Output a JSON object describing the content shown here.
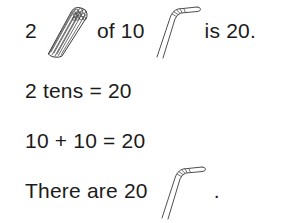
{
  "page": {
    "type": "math-worksheet-statement",
    "background_color": "#ffffff",
    "text_color": "#1b1b1b",
    "ink_color": "#4a4a4a"
  },
  "lines": [
    {
      "id": "line-1",
      "parts": {
        "count": "2",
        "bundle_icon": "straw-bundle-icon",
        "connector": "of 10",
        "single_icon": "straw-icon",
        "result": "is 20."
      }
    },
    {
      "id": "line-2",
      "text": "2 tens = 20"
    },
    {
      "id": "line-3",
      "text": "10 + 10 = 20"
    },
    {
      "id": "line-4",
      "parts": {
        "lead": "There are 20",
        "single_icon": "straw-icon",
        "period": "."
      }
    }
  ],
  "math": {
    "bundles": 2,
    "per_bundle": 10,
    "total": 20,
    "addends": [
      10,
      10
    ]
  }
}
